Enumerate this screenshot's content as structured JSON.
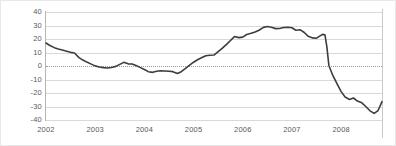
{
  "chart_data": {
    "type": "line",
    "title": "",
    "subtitle": "",
    "xlabel": "",
    "ylabel": "",
    "xlim": [
      2002.0,
      2008.83
    ],
    "ylim": [
      -40,
      40
    ],
    "grid": true,
    "legend": null,
    "zero_reference_line": 0,
    "line_color": "#3d3d3d",
    "grid_color": "#d9d9d9",
    "axis_color": "#b4b4b4",
    "yticks": [
      40,
      30,
      20,
      10,
      0,
      -10,
      -20,
      -30,
      -40
    ],
    "ytick_labels": [
      "40",
      "30",
      "20",
      "10",
      "0",
      "-10",
      "-20",
      "-30",
      "-40"
    ],
    "xticks": [
      2002,
      2003,
      2004,
      2005,
      2006,
      2007,
      2008
    ],
    "xtick_labels": [
      "2002",
      "2003",
      "2004",
      "2005",
      "2006",
      "2007",
      "2008"
    ],
    "series": [
      {
        "name": "series-1",
        "color": "#3d3d3d",
        "points": [
          [
            2002.0,
            17.0
          ],
          [
            2002.08,
            15.2
          ],
          [
            2002.17,
            13.6
          ],
          [
            2002.25,
            12.6
          ],
          [
            2002.33,
            11.9
          ],
          [
            2002.42,
            11.0
          ],
          [
            2002.5,
            10.1
          ],
          [
            2002.58,
            9.6
          ],
          [
            2002.67,
            6.2
          ],
          [
            2002.75,
            4.4
          ],
          [
            2002.83,
            2.9
          ],
          [
            2002.92,
            1.4
          ],
          [
            2003.0,
            0.1
          ],
          [
            2003.08,
            -0.7
          ],
          [
            2003.17,
            -1.2
          ],
          [
            2003.25,
            -1.5
          ],
          [
            2003.33,
            -1.1
          ],
          [
            2003.42,
            -0.3
          ],
          [
            2003.5,
            1.2
          ],
          [
            2003.58,
            2.7
          ],
          [
            2003.67,
            1.6
          ],
          [
            2003.75,
            1.5
          ],
          [
            2003.83,
            0.3
          ],
          [
            2003.92,
            -1.2
          ],
          [
            2004.0,
            -2.6
          ],
          [
            2004.08,
            -4.2
          ],
          [
            2004.17,
            -4.7
          ],
          [
            2004.25,
            -3.9
          ],
          [
            2004.33,
            -3.5
          ],
          [
            2004.42,
            -3.7
          ],
          [
            2004.5,
            -3.9
          ],
          [
            2004.58,
            -4.2
          ],
          [
            2004.67,
            -5.6
          ],
          [
            2004.75,
            -4.2
          ],
          [
            2004.83,
            -2.0
          ],
          [
            2004.92,
            0.6
          ],
          [
            2005.0,
            2.8
          ],
          [
            2005.08,
            4.6
          ],
          [
            2005.17,
            6.3
          ],
          [
            2005.25,
            7.6
          ],
          [
            2005.33,
            8.0
          ],
          [
            2005.42,
            8.2
          ],
          [
            2005.5,
            10.6
          ],
          [
            2005.58,
            13.0
          ],
          [
            2005.67,
            16.0
          ],
          [
            2005.75,
            18.9
          ],
          [
            2005.83,
            21.8
          ],
          [
            2005.92,
            21.0
          ],
          [
            2006.0,
            21.4
          ],
          [
            2006.08,
            23.3
          ],
          [
            2006.17,
            24.2
          ],
          [
            2006.25,
            25.2
          ],
          [
            2006.33,
            26.5
          ],
          [
            2006.42,
            28.6
          ],
          [
            2006.5,
            29.2
          ],
          [
            2006.58,
            28.7
          ],
          [
            2006.67,
            27.7
          ],
          [
            2006.75,
            27.8
          ],
          [
            2006.83,
            28.5
          ],
          [
            2006.92,
            28.7
          ],
          [
            2007.0,
            28.3
          ],
          [
            2007.08,
            26.5
          ],
          [
            2007.17,
            26.8
          ],
          [
            2007.25,
            24.8
          ],
          [
            2007.33,
            22.0
          ],
          [
            2007.42,
            20.8
          ],
          [
            2007.5,
            20.6
          ],
          [
            2007.58,
            22.5
          ],
          [
            2007.62,
            23.4
          ],
          [
            2007.67,
            23.2
          ],
          [
            2007.71,
            14.0
          ],
          [
            2007.75,
            0.4
          ],
          [
            2007.83,
            -7.0
          ],
          [
            2007.92,
            -13.5
          ],
          [
            2008.0,
            -19.0
          ],
          [
            2008.08,
            -23.0
          ],
          [
            2008.17,
            -24.8
          ],
          [
            2008.25,
            -23.7
          ],
          [
            2008.33,
            -26.0
          ],
          [
            2008.42,
            -27.3
          ],
          [
            2008.5,
            -30.0
          ],
          [
            2008.58,
            -33.0
          ],
          [
            2008.67,
            -35.1
          ],
          [
            2008.75,
            -33.0
          ],
          [
            2008.83,
            -26.4
          ]
        ]
      }
    ]
  }
}
